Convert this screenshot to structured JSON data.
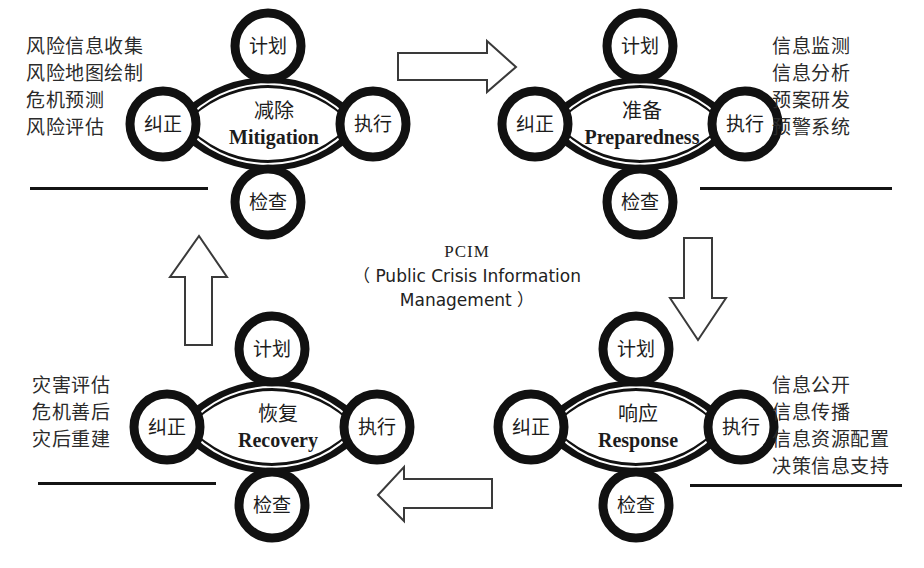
{
  "diagram": {
    "title_center": {
      "acronym": "PCIM",
      "expansion_line1": "（ Public Crisis Information",
      "expansion_line2": "Management ）"
    },
    "node_labels": {
      "plan": "计划",
      "do": "执行",
      "check": "检查",
      "act": "纠正"
    },
    "phases": [
      {
        "id": "mitigation",
        "cn": "减除",
        "en": "Mitigation",
        "quadrant": "top-left",
        "list_side": "left",
        "items": [
          "风险信息收集",
          "风险地图绘制",
          "危机预测",
          "风险评估"
        ]
      },
      {
        "id": "preparedness",
        "cn": "准备",
        "en": "Preparedness",
        "quadrant": "top-right",
        "list_side": "right",
        "items": [
          "信息监测",
          "信息分析",
          "预案研发",
          "预警系统"
        ]
      },
      {
        "id": "response",
        "cn": "响应",
        "en": "Response",
        "quadrant": "bottom-right",
        "list_side": "right",
        "items": [
          "信息公开",
          "信息传播",
          "信息资源配置",
          "决策信息支持"
        ]
      },
      {
        "id": "recovery",
        "cn": "恢复",
        "en": "Recovery",
        "quadrant": "bottom-left",
        "list_side": "left",
        "items": [
          "灾害评估",
          "危机善后",
          "灾后重建"
        ]
      }
    ],
    "arrows": [
      {
        "id": "top-arrow",
        "direction": "right",
        "from": "mitigation",
        "to": "preparedness"
      },
      {
        "id": "right-arrow",
        "direction": "down",
        "from": "preparedness",
        "to": "response"
      },
      {
        "id": "bottom-arrow",
        "direction": "left",
        "from": "response",
        "to": "recovery"
      },
      {
        "id": "left-arrow",
        "direction": "up",
        "from": "recovery",
        "to": "mitigation"
      }
    ],
    "colors": {
      "stroke": "#111111",
      "text": "#222222",
      "background": "#ffffff",
      "arrow_stroke": "#3a3a3a"
    }
  }
}
